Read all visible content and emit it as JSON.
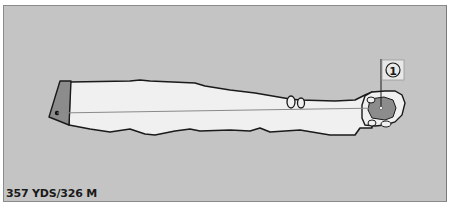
{
  "hole": {
    "number": "1",
    "length_label": "357 YDS/326 M"
  },
  "colors": {
    "background": "#c4c4c4",
    "fairway": "#f0f0f0",
    "tee": "#8c8c8c",
    "green": "#8c8c8c",
    "outline": "#1a1a1a",
    "line_of_play": "#8a8a8a"
  }
}
